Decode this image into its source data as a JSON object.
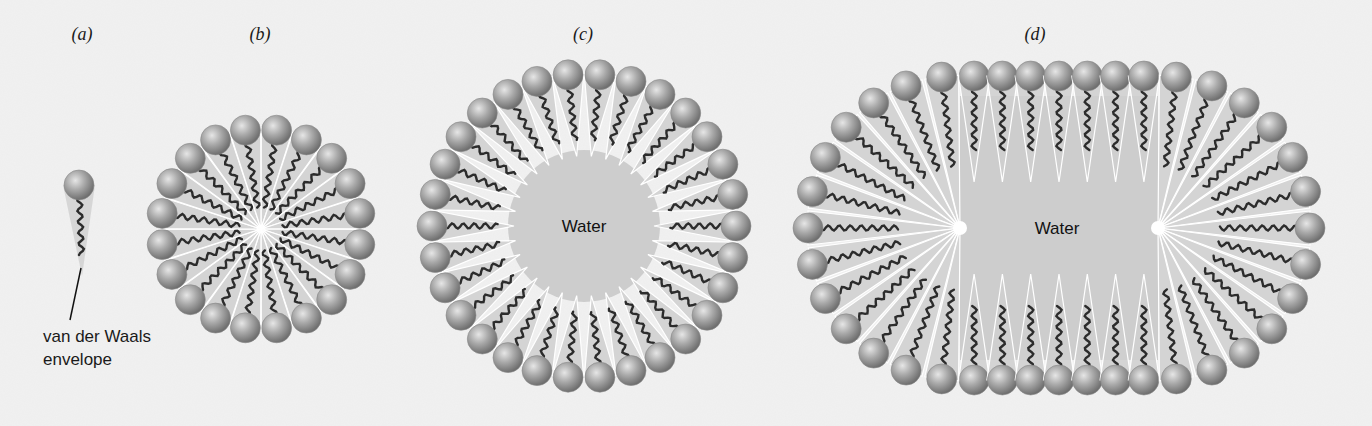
{
  "figure": {
    "background": "#f1f1f1",
    "colors": {
      "head_light": "#d9d9d9",
      "head_mid": "#a8a8a8",
      "head_dark": "#6e6e6e",
      "tail": "#2c2c2c",
      "envelope": "#cfcfcf",
      "envelope_edge": "#ffffff",
      "water": "#cdcdcd"
    },
    "panels": [
      {
        "id": "a",
        "label": "(a)",
        "label_pos": [
          82,
          40
        ],
        "type": "single",
        "head": [
          79,
          185
        ],
        "tail_end": [
          82,
          268
        ],
        "annotation": {
          "lines": [
            "van der Waals",
            "envelope"
          ],
          "text_pos": [
            43,
            342
          ],
          "line_height": 23,
          "leader": [
            [
              81,
              268
            ],
            [
              70,
              320
            ]
          ]
        }
      },
      {
        "id": "b",
        "label": "(b)",
        "label_pos": [
          260,
          40
        ],
        "type": "micelle",
        "center": [
          261,
          229
        ],
        "radius": 100,
        "count": 20,
        "inner_radius": 0
      },
      {
        "id": "c",
        "label": "(c)",
        "label_pos": [
          583,
          40
        ],
        "type": "vesicle",
        "center": [
          584,
          226
        ],
        "radius": 152,
        "count": 30,
        "inner_radius": 70,
        "water_label": "Water"
      },
      {
        "id": "d",
        "label": "(d)",
        "label_pos": [
          1035,
          40
        ],
        "type": "capsule",
        "left_center": [
          960,
          228
        ],
        "right_center": [
          1158,
          228
        ],
        "radius": 152,
        "end_count": 13,
        "straight_count": 7,
        "inner_offset": 84,
        "water_label": "Water",
        "water_pos": [
          1057,
          234
        ]
      }
    ]
  }
}
